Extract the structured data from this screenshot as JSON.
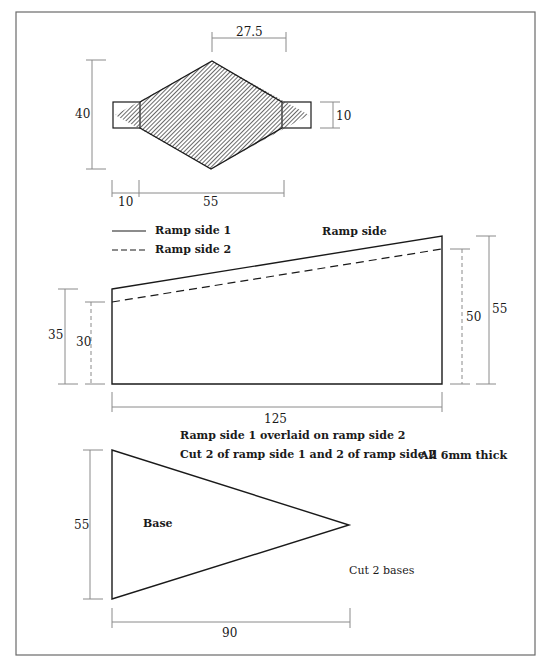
{
  "diagram": {
    "colors": {
      "outline": "#1a1a1a",
      "dimension_line": "#8a8a8a",
      "hatch": "#555555",
      "frame": "#6a6a6a",
      "background": "#ffffff"
    },
    "top_part": {
      "shape": "diamond with end tabs (hatched)",
      "dimensions": {
        "half_width": "27.5",
        "height": "40",
        "tab_height": "10",
        "tab_length": "10",
        "diamond_length": "55"
      }
    },
    "legend": {
      "items": [
        {
          "style": "solid",
          "label": "Ramp side 1"
        },
        {
          "style": "dashed",
          "label": "Ramp side 2"
        }
      ]
    },
    "ramp_side": {
      "title": "Ramp side",
      "dimensions": {
        "side1_left_height": "35",
        "side2_left_height": "30",
        "side2_right_height": "50",
        "side1_right_height": "55",
        "length": "125"
      },
      "notes": [
        "Ramp side 1  overlaid on ramp side 2",
        "Cut 2 of ramp side 1 and 2 of ramp side 2"
      ],
      "thickness_note": "All 6mm thick"
    },
    "base": {
      "label": "Base",
      "dimensions": {
        "height": "55",
        "length": "90"
      },
      "note": "Cut 2 bases"
    }
  }
}
